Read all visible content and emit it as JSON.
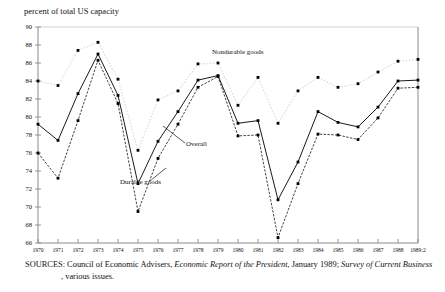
{
  "axis_title": "percent of total US capacity",
  "annotations": [
    {
      "id": "nondurable",
      "label": "Nondurable goods"
    },
    {
      "id": "overall",
      "label": "Overall"
    },
    {
      "id": "durable",
      "label": "Durable goods"
    }
  ],
  "source": {
    "prefix": "SOURCES: Council of Economic Advisers, ",
    "italic1": "Economic Report of the President",
    "mid": ", January 1989; ",
    "italic2": "Survey of Current Business",
    "suffix": ", various issues."
  },
  "chart_data": {
    "type": "line",
    "title": "",
    "xlabel": "",
    "ylabel": "percent of total US capacity",
    "ylim": [
      66,
      90
    ],
    "ytickstep": 2,
    "yticks": [
      66,
      68,
      70,
      72,
      74,
      76,
      78,
      80,
      82,
      84,
      86,
      88,
      90
    ],
    "grid": false,
    "legend": "inline-annotations",
    "categories": [
      "1970",
      "1971",
      "1972",
      "1973",
      "1974",
      "1975",
      "1976",
      "1977",
      "1978",
      "1979",
      "1980",
      "1981",
      "1982",
      "1983",
      "1984",
      "1985",
      "1986",
      "1987",
      "1988",
      "1989:2"
    ],
    "series": [
      {
        "name": "Nondurable goods",
        "style": "dotted-light",
        "values": [
          84.0,
          83.5,
          87.4,
          88.3,
          84.2,
          76.3,
          81.9,
          82.9,
          85.9,
          86.0,
          81.3,
          84.4,
          79.3,
          82.9,
          84.4,
          83.3,
          83.7,
          85.0,
          86.2,
          86.4
        ]
      },
      {
        "name": "Overall",
        "style": "solid",
        "values": [
          79.2,
          77.4,
          82.6,
          87.0,
          82.4,
          72.6,
          77.3,
          80.6,
          84.1,
          84.6,
          79.3,
          79.6,
          70.8,
          75.0,
          80.6,
          79.4,
          78.9,
          81.1,
          84.0,
          84.1
        ]
      },
      {
        "name": "Durable goods",
        "style": "dashed",
        "values": [
          76.0,
          73.2,
          79.6,
          86.3,
          81.5,
          69.5,
          75.4,
          79.2,
          83.3,
          84.5,
          77.9,
          78.0,
          66.6,
          72.6,
          78.1,
          78.0,
          77.5,
          79.9,
          83.2,
          83.3
        ]
      }
    ]
  }
}
